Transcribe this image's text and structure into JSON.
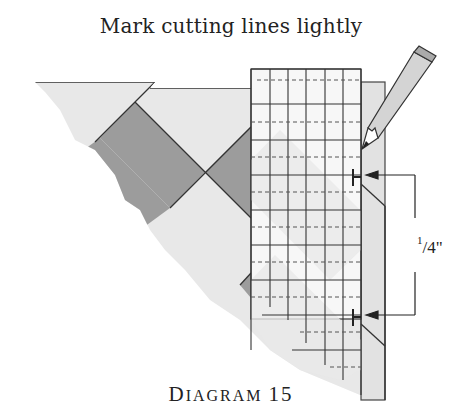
{
  "title": "Mark cutting lines lightly",
  "caption": {
    "first_letter": "D",
    "rest": "IAGRAM",
    "number": "15"
  },
  "measurement": {
    "numerator": "1",
    "slash_denominator": "/4\""
  },
  "colors": {
    "light_fabric": "#e6e6e6",
    "dark_fabric": "#9a9a9a",
    "ruler_grid": "#333333",
    "outline": "#333333"
  },
  "ruler": {
    "columns": 6,
    "solid_rows_px": [
      69,
      104,
      140,
      175,
      210,
      245,
      280,
      315,
      350
    ],
    "dashed_rows_px": [
      80,
      122,
      157,
      192,
      227,
      262,
      297,
      332,
      367
    ]
  },
  "icons": [
    "pencil-icon",
    "arrow-icon",
    "tick-mark-icon"
  ]
}
